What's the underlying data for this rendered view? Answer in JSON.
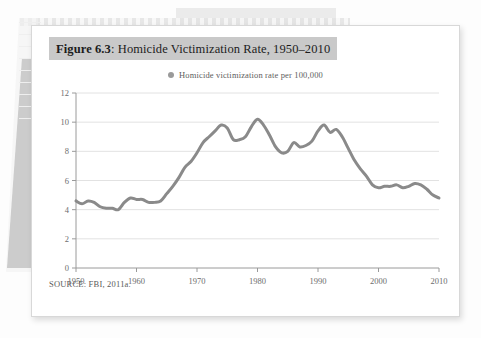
{
  "figure": {
    "label": "Figure 6.3",
    "separator": ":",
    "title": "Homicide Victimization Rate, 1950–2010",
    "source": "SOURCE: FBI, 2011a.",
    "title_band_color": "#c9c9c9",
    "card_bg": "#ffffff"
  },
  "legend": {
    "marker_icon": "filled-circle-marker",
    "marker_color": "#9a9a9a",
    "label": "Homicide victimization rate per 100,000"
  },
  "background": {
    "band_color": "#ebebeb",
    "page_edge_color": "#c9c9c9"
  },
  "chart_data": {
    "type": "line",
    "title": "Homicide Victimization Rate, 1950–2010",
    "xlabel": "",
    "ylabel": "",
    "xlim": [
      1950,
      2010
    ],
    "ylim": [
      0,
      12
    ],
    "grid": true,
    "grid_color": "#e2e2e2",
    "legend_position": "top-center",
    "line_color": "#8a8a8a",
    "line_width": 3,
    "xticks": [
      1950,
      1960,
      1970,
      1980,
      1990,
      2000,
      2010
    ],
    "yticks": [
      0,
      2,
      4,
      6,
      8,
      10,
      12
    ],
    "series": [
      {
        "name": "Homicide victimization rate per 100,000",
        "x": [
          1950,
          1951,
          1952,
          1953,
          1954,
          1955,
          1956,
          1957,
          1958,
          1959,
          1960,
          1961,
          1962,
          1963,
          1964,
          1965,
          1966,
          1967,
          1968,
          1969,
          1970,
          1971,
          1972,
          1973,
          1974,
          1975,
          1976,
          1977,
          1978,
          1979,
          1980,
          1981,
          1982,
          1983,
          1984,
          1985,
          1986,
          1987,
          1988,
          1989,
          1990,
          1991,
          1992,
          1993,
          1994,
          1995,
          1996,
          1997,
          1998,
          1999,
          2000,
          2001,
          2002,
          2003,
          2004,
          2005,
          2006,
          2007,
          2008,
          2009,
          2010
        ],
        "values": [
          4.6,
          4.4,
          4.6,
          4.5,
          4.2,
          4.1,
          4.1,
          4.0,
          4.5,
          4.8,
          4.7,
          4.7,
          4.5,
          4.5,
          4.6,
          5.1,
          5.6,
          6.2,
          6.9,
          7.3,
          7.9,
          8.6,
          9.0,
          9.4,
          9.8,
          9.6,
          8.8,
          8.8,
          9.0,
          9.7,
          10.2,
          9.8,
          9.1,
          8.3,
          7.9,
          8.0,
          8.6,
          8.3,
          8.4,
          8.7,
          9.4,
          9.8,
          9.3,
          9.5,
          9.0,
          8.2,
          7.4,
          6.8,
          6.3,
          5.7,
          5.5,
          5.6,
          5.6,
          5.7,
          5.5,
          5.6,
          5.8,
          5.7,
          5.4,
          5.0,
          4.8
        ]
      }
    ]
  }
}
